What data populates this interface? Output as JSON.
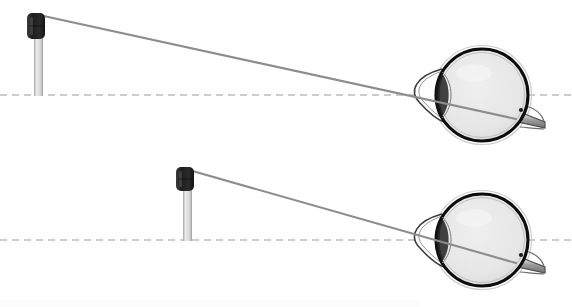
{
  "figure": {
    "background_color": "#ffffff",
    "width": 572,
    "height": 307
  },
  "colors": {
    "background": "#ffffff",
    "ray_line": "#8c8c8c",
    "axis_dashed": "#9a9a9a",
    "pole_body_light": "#e3e3e3",
    "pole_body_mid": "#c6c6c6",
    "pole_head_dark": "#2b2b2b",
    "pole_head_darker": "#1a1a1a",
    "eye_outline": "#111111",
    "eye_sclera_outer": "#ffffff",
    "eye_interior": "#e8e8e8",
    "eye_interior_edge": "#d2d2d2",
    "cornea_stroke": "#3a3a3a",
    "optic_nerve": "#8f8f8f",
    "faint_caption": "#fbfbfb"
  },
  "panels": [
    {
      "id": "panel-top",
      "label": "Top diagram — distant tall object",
      "axis": {
        "name": "optical-axis-dashed-line",
        "y": 95,
        "x_start": 0,
        "x_end": 572,
        "dash": "7 5",
        "width": 1
      },
      "object": {
        "name": "object-pole-top",
        "pole_x": 34,
        "pole_top_y": 17,
        "pole_bottom_y": 96,
        "pole_width": 9,
        "head_x": 27,
        "head_y": 13,
        "head_width": 18,
        "head_height": 26,
        "head_radius": 5
      },
      "ray": {
        "name": "light-ray-top",
        "x1": 39,
        "y1": 15,
        "x2": 516,
        "y2": 119,
        "width": 2.1
      },
      "eye": {
        "name": "eye-diagram-top",
        "center_x": 482,
        "center_y": 95,
        "radius": 46,
        "cornea_tip_x": 420,
        "nerve_end_x": 545,
        "nerve_end_y": 122
      }
    },
    {
      "id": "panel-bottom",
      "label": "Bottom diagram — nearer short object",
      "axis": {
        "name": "optical-axis-dashed-line",
        "y": 240,
        "x_start": 0,
        "x_end": 572,
        "dash": "7 5",
        "width": 1
      },
      "object": {
        "name": "object-pole-bottom",
        "pole_x": 183,
        "pole_top_y": 172,
        "pole_bottom_y": 241,
        "pole_width": 9,
        "head_x": 176,
        "head_y": 167,
        "head_width": 18,
        "head_height": 24,
        "head_radius": 5
      },
      "ray": {
        "name": "light-ray-bottom",
        "x1": 189,
        "y1": 170,
        "x2": 516,
        "y2": 263,
        "width": 2.1
      },
      "eye": {
        "name": "eye-diagram-bottom",
        "center_x": 482,
        "center_y": 240,
        "radius": 46,
        "cornea_tip_x": 420,
        "nerve_end_x": 545,
        "nerve_end_y": 267
      }
    }
  ],
  "caption": {
    "name": "cropped-caption-strip",
    "text": "",
    "visible": false
  }
}
